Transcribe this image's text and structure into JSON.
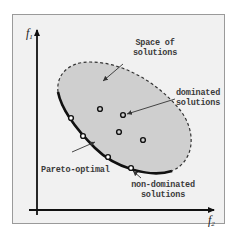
{
  "diagram": {
    "type": "pareto-front-illustration",
    "axes": {
      "y_label": "f",
      "y_label_sub": "1",
      "x_label": "f",
      "x_label_sub": "2"
    },
    "labels": {
      "space_of_solutions_line1": "Space of",
      "space_of_solutions_line2": "solutions",
      "dominated_line1": "dominated",
      "dominated_line2": "solutions",
      "pareto_optimal": "Pareto-optimal",
      "non_dominated_line1": "non-dominated",
      "non_dominated_line2": "solutions"
    },
    "dominated_points": [
      {
        "x": 100,
        "y": 109
      },
      {
        "x": 123,
        "y": 115
      },
      {
        "x": 119,
        "y": 132
      },
      {
        "x": 143,
        "y": 140
      }
    ],
    "non_dominated_points": [
      {
        "x": 71,
        "y": 118
      },
      {
        "x": 83,
        "y": 136
      },
      {
        "x": 108,
        "y": 157
      },
      {
        "x": 131,
        "y": 168
      }
    ],
    "colors": {
      "background": "#f1f1f1",
      "region_fill": "#cfcfcf",
      "border": "#9a9a9a",
      "line": "#111111",
      "text": "#3a3a3a"
    }
  }
}
